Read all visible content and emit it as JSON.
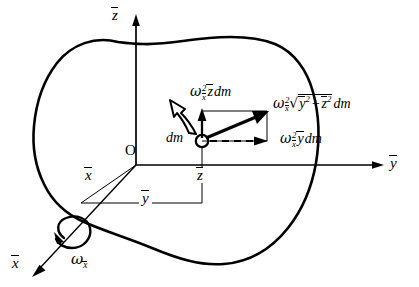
{
  "figure": {
    "background_color": "#ffffff",
    "ink_color": "#000000",
    "width": 419,
    "height": 287
  },
  "axes": {
    "z": {
      "label": "z",
      "accent": "bar",
      "direction": "up"
    },
    "y": {
      "label": "y",
      "accent": "bar",
      "direction": "right"
    },
    "x": {
      "label": "x",
      "accent": "bar",
      "direction": "down-left"
    },
    "origin_label": "O"
  },
  "rotation": {
    "symbol": "ω",
    "subscript": "x",
    "subscript_accent": "bar",
    "label_text": "ωx̄",
    "axis": "x",
    "arrow_style": "curved-double-headed-spin"
  },
  "mass_element": {
    "label": "dm",
    "marker": "open-circle"
  },
  "dimensions": {
    "y_bar": {
      "label": "y",
      "accent": "bar"
    },
    "z_bar": {
      "label": "z",
      "accent": "bar"
    }
  },
  "vectors": {
    "vertical_component": {
      "name": "omega-squared-zbar-dm",
      "omega": "ω",
      "sup": "2",
      "sub": "x",
      "sub_accent": "bar",
      "factor": "z",
      "factor_accent": "bar",
      "mass_term": "dm",
      "plain_text": "ω²x̄ z̄ dm",
      "style": "solid-arrow",
      "direction": "up"
    },
    "horizontal_component": {
      "name": "omega-squared-ybar-dm",
      "omega": "ω",
      "sup": "2",
      "sub": "x",
      "sub_accent": "bar",
      "factor": "y",
      "factor_accent": "bar",
      "mass_term": "dm",
      "plain_text": "ω²x̄ ȳ dm",
      "style": "dashed-arrow",
      "direction": "right"
    },
    "resultant": {
      "name": "omega-squared-radius-dm",
      "omega": "ω",
      "sup": "2",
      "sub": "x",
      "sub_accent": "bar",
      "radicand_first": "y",
      "radicand_first_sup": "2",
      "radicand_op": "+",
      "radicand_second": "z",
      "radicand_second_sup": "2",
      "mass_term": "dm",
      "plain_text": "ω²x̄ √(ȳ² + z̄²) dm",
      "style": "thick-solid-arrow",
      "direction": "up-right"
    }
  }
}
